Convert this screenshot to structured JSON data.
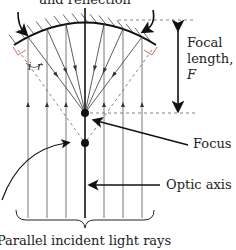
{
  "diagram": {
    "top_caption": "and reflection",
    "labels": {
      "focal_length_line1": "Focal",
      "focal_length_line2": "length,",
      "focal_length_symbol": "F",
      "focus": "Focus",
      "optic_axis": "Optic axis",
      "parallel_rays": "Parallel incident light rays",
      "angle_incidence": "i",
      "angle_reflection": "r"
    },
    "colors": {
      "ink": "#1a1a1a",
      "ray": "#333333",
      "normal_marker": "#d04040",
      "dashed": "#555555"
    }
  }
}
